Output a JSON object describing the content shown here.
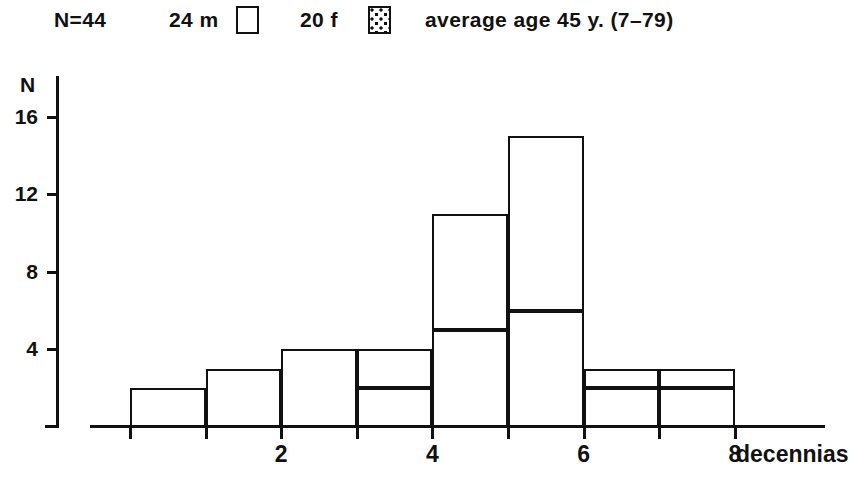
{
  "legend": {
    "n_label": "N=44",
    "male_count_label": "24 m",
    "male_swatch": "white-square-swatch",
    "female_count_label": "20 f",
    "female_swatch": "dotted-square-swatch",
    "average_age_label": "average age 45 y. (7–79)"
  },
  "axes": {
    "y_title": "N",
    "y_ticks": [
      "16",
      "12",
      "8",
      "4"
    ],
    "x_ticks": [
      "2",
      "4",
      "6",
      "8"
    ],
    "x_title": "decennias"
  },
  "chart_data": {
    "type": "bar",
    "title": "",
    "subtitle": "N=44   24 m   20 f   average age 45 y. (7-79)",
    "xlabel": "decennias",
    "ylabel": "N",
    "xlim": [
      0,
      9
    ],
    "ylim": [
      0,
      17
    ],
    "yticks": [
      4,
      8,
      12,
      16
    ],
    "xticks": [
      2,
      4,
      6,
      8
    ],
    "grid": false,
    "stacked": true,
    "legend_position": "top",
    "categories": [
      "0–1",
      "1–2",
      "2–3",
      "3–4",
      "4–5",
      "5–6",
      "6–7",
      "7–8"
    ],
    "bar_left_edges": [
      0,
      1,
      2,
      3,
      4,
      5,
      6,
      7
    ],
    "series": [
      {
        "name": "24 m",
        "fill": "white",
        "values": [
          0,
          3,
          4,
          2,
          5,
          6,
          2,
          2
        ]
      },
      {
        "name": "20 f",
        "fill": "dotted",
        "values": [
          2,
          0,
          0,
          2,
          6,
          9,
          1,
          1
        ]
      }
    ],
    "totals": [
      2,
      3,
      4,
      4,
      11,
      15,
      3,
      3
    ]
  },
  "colors": {
    "ink": "#111111",
    "paper": "#ffffff"
  }
}
